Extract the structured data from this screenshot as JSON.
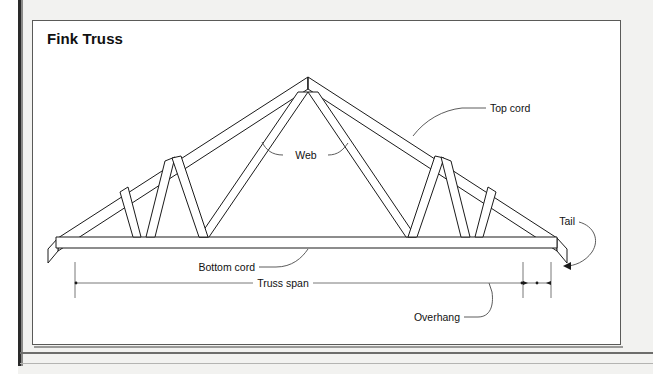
{
  "figure": {
    "title": "Fink Truss",
    "type": "technical-illustration",
    "line_color": "#1a1a1a",
    "background_color": "#ffffff",
    "page_margin_color": "#f2f2f0"
  },
  "labels": {
    "top_cord": "Top cord",
    "web": "Web",
    "tail": "Tail",
    "bottom_cord": "Bottom cord",
    "truss_span": "Truss span",
    "overhang": "Overhang"
  },
  "annotations": [
    {
      "name": "top-cord",
      "text": "Top cord",
      "leader": "curved",
      "points_to": "upper right rafter"
    },
    {
      "name": "web",
      "text": "Web",
      "leader": "curved-double",
      "points_to": "two interior web members"
    },
    {
      "name": "tail",
      "text": "Tail",
      "leader": "curved-arrow",
      "points_to": "right rafter overhang end"
    },
    {
      "name": "bottom-cord",
      "text": "Bottom cord",
      "leader": "curved",
      "points_to": "bottom chord"
    },
    {
      "name": "truss-span",
      "text": "Truss span",
      "leader": "dimension-line",
      "points_to": "bearing to bearing width"
    },
    {
      "name": "overhang",
      "text": "Overhang",
      "leader": "curved",
      "points_to": "right overhang dimension"
    }
  ],
  "dimensions": [
    {
      "name": "truss-span",
      "label": "Truss span",
      "style": "extension-lines-with-ticks"
    },
    {
      "name": "overhang",
      "label": "Overhang",
      "style": "short-arrows-between-extension-lines"
    }
  ]
}
